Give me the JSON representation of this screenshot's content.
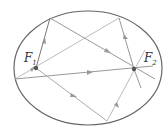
{
  "diagram": {
    "ellipse": {
      "cx": 88,
      "cy": 68,
      "rx": 74,
      "ry": 57,
      "stroke": "#666666"
    },
    "foci": [
      {
        "name": "F",
        "sub": "1",
        "x": 36,
        "y": 68
      },
      {
        "name": "F",
        "sub": "2",
        "x": 134,
        "y": 69
      }
    ],
    "ray_color": "#aaaaaa",
    "dark_ray_color": "#777777"
  }
}
